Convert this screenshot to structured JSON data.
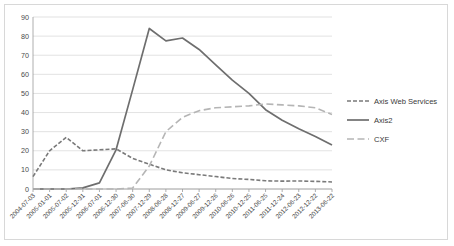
{
  "chart_data": {
    "type": "line",
    "title": "",
    "xlabel": "",
    "ylabel": "",
    "ylim": [
      0,
      90
    ],
    "ytick_step": 10,
    "yticks": [
      0,
      10,
      20,
      30,
      40,
      50,
      60,
      70,
      80,
      90
    ],
    "grid": true,
    "legend_position": "right",
    "categories": [
      "2004-07-03",
      "2005-01-01",
      "2005-07-02",
      "2005-12-31",
      "2006-07-01",
      "2006-12-30",
      "2007-06-30",
      "2007-12-29",
      "2008-06-28",
      "2008-12-27",
      "2009-06-27",
      "2009-12-26",
      "2010-06-26",
      "2010-12-25",
      "2011-06-25",
      "2011-12-24",
      "2012-06-23",
      "2012-12-22",
      "2013-06-22"
    ],
    "series": [
      {
        "name": "Axis Web Services",
        "color": "#7a7a7a",
        "style": "dashed",
        "dasharray": "4,2",
        "width": 1.6,
        "values": [
          6.5,
          20,
          27,
          20,
          20.5,
          21,
          16,
          13,
          10,
          8.5,
          7.5,
          6.5,
          5.5,
          5,
          4.3,
          4.1,
          4.2,
          4,
          3.7
        ]
      },
      {
        "name": "Axis2",
        "color": "#6e6e6e",
        "style": "solid",
        "dasharray": "",
        "width": 1.7,
        "values": [
          0,
          0,
          0,
          0.6,
          3.2,
          20.5,
          52,
          84,
          77.5,
          79,
          73,
          65,
          57,
          50,
          41.5,
          36,
          31.5,
          27.5,
          23
        ]
      },
      {
        "name": "CXF",
        "color": "#b5b5b5",
        "style": "long-dashed",
        "dasharray": "7,3.5",
        "width": 1.6,
        "values": [
          0,
          0,
          0,
          0,
          0,
          0,
          0.5,
          12,
          30,
          37.5,
          41,
          42.5,
          43,
          43.5,
          44.5,
          44,
          43.5,
          42.5,
          39
        ]
      }
    ]
  },
  "legend": {
    "items": [
      {
        "label": "Axis Web Services"
      },
      {
        "label": "Axis2"
      },
      {
        "label": "CXF"
      }
    ]
  }
}
